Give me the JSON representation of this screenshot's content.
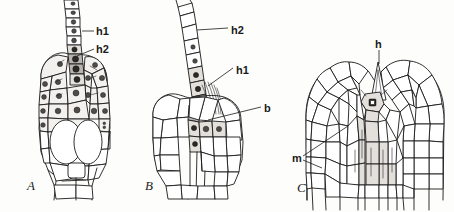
{
  "figure": {
    "kind": "scientific-line-drawing",
    "background_color": "#fdfdfc",
    "ink_color": "#1a1a1a",
    "nucleus_fill": "#4a4a4a",
    "shade_fill": "#e6e4e0"
  },
  "panels": [
    {
      "id": "A",
      "letter": "A",
      "description": "conical apex with attached multicellular filament, dense nucleated cells above large empty basal cells",
      "labels": [
        {
          "key": "h1",
          "text": "h1",
          "x": 96,
          "y": 32
        },
        {
          "key": "h2",
          "text": "h2",
          "x": 96,
          "y": 50
        }
      ]
    },
    {
      "id": "B",
      "letter": "B",
      "description": "rounded apex with long curved filament emerging, darkly stained cells at insertion point",
      "labels": [
        {
          "key": "h2",
          "text": "h2",
          "x": 231,
          "y": 31
        },
        {
          "key": "h1",
          "text": "h1",
          "x": 236,
          "y": 71
        },
        {
          "key": "b",
          "text": "b",
          "x": 264,
          "y": 110
        }
      ]
    },
    {
      "id": "C",
      "letter": "C",
      "description": "two adjacent lobed apices forming a cleft, with pointed hair structure in the notch and elongated inner cells",
      "labels": [
        {
          "key": "h",
          "text": "h",
          "x": 381,
          "y": 59
        },
        {
          "key": "m",
          "text": "m",
          "x": 295,
          "y": 159
        }
      ]
    }
  ]
}
